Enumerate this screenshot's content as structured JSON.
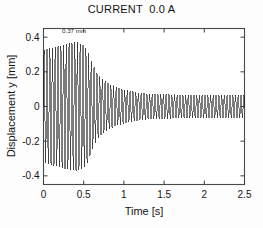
{
  "figure": {
    "background_color": "#fdfdfd",
    "plot_background_color": "#ffffff",
    "frame_color": "#4a4a4a",
    "trace_color": "#101010"
  },
  "chart_data": {
    "type": "line",
    "title": "CURRENT  0.0 A",
    "subtitle": "",
    "xlabel": "Time  [s]",
    "ylabel": "Displacement  y  [mm]",
    "xlim": [
      0,
      2.5
    ],
    "ylim": [
      -0.45,
      0.45
    ],
    "xticks": [
      0,
      0.5,
      1,
      1.5,
      2,
      2.5
    ],
    "xticklabels": [
      "0",
      "0.5",
      "1",
      "1.5",
      "2",
      "2.5"
    ],
    "yticks": [
      0.4,
      0.2,
      0,
      -0.2,
      -0.4
    ],
    "yticklabels": [
      "0.4",
      "0.2",
      "0",
      "-0.2",
      "-0.4"
    ],
    "grid": false,
    "legend": null,
    "legend_position": "none",
    "annotations": [
      {
        "text": "0.37 mm",
        "x": 0.38,
        "y": 0.425,
        "describes": "peak displacement amplitude"
      }
    ],
    "signal": {
      "description": "Damped self-excited vibration: amplitude rises from 0.32 mm at t=0 to a peak of 0.37 mm near t=0.42 s, then decays rapidly and settles to a steady-state amplitude of about 0.065 mm after t=1.3 s.",
      "oscillation_frequency_hz": 29,
      "mean_value": 0,
      "envelope_t": [
        0.0,
        0.1,
        0.2,
        0.3,
        0.38,
        0.42,
        0.5,
        0.55,
        0.6,
        0.65,
        0.7,
        0.8,
        0.9,
        1.0,
        1.1,
        1.2,
        1.3,
        1.5,
        1.75,
        2.0,
        2.25,
        2.5
      ],
      "envelope_amplitude": [
        0.325,
        0.338,
        0.35,
        0.362,
        0.37,
        0.37,
        0.352,
        0.32,
        0.258,
        0.205,
        0.172,
        0.134,
        0.112,
        0.098,
        0.088,
        0.079,
        0.074,
        0.07,
        0.068,
        0.067,
        0.066,
        0.066
      ],
      "peak_amplitude_mm": 0.37,
      "peak_time_s": 0.42,
      "steady_state_amplitude_mm": 0.066,
      "initial_amplitude_mm": 0.325
    }
  }
}
